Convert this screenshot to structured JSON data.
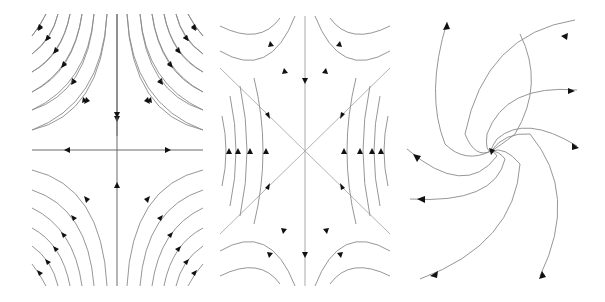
{
  "figure": {
    "panels": [
      {
        "id": "saddle",
        "label": "",
        "type": "phase-portrait",
        "description": "saddle point: flow inward along vertical axis, outward along horizontal axis"
      },
      {
        "id": "saddle-diagonal",
        "label": "",
        "type": "phase-portrait",
        "description": "saddle with diagonal separatrices, flow inward vertically, outward horizontally"
      },
      {
        "id": "spiral-sink",
        "label": "",
        "type": "phase-portrait",
        "description": "stable spiral: trajectories spiraling into the origin"
      }
    ],
    "colors": {
      "trajectory": "#8a8a8a",
      "axis": "#6a6a6a",
      "arrow": "#111111",
      "background": "#ffffff"
    }
  }
}
